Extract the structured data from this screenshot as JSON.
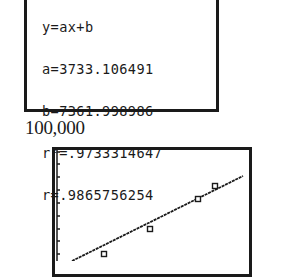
{
  "regression_screen": {
    "lines": [
      "y=ax+b",
      "a=3733.106491",
      "b=7361.998986",
      "r²=.9733314647",
      "r=.9865756254"
    ]
  },
  "graph": {
    "ymax_label": "100,000",
    "points_px": [
      [
        104,
        254
      ],
      [
        150,
        229
      ],
      [
        198,
        199
      ],
      [
        215,
        186
      ]
    ],
    "regression_line_px": [
      [
        72,
        261
      ],
      [
        243,
        176
      ]
    ],
    "yaxis_ticks_px": [
      152,
      164,
      177,
      190,
      203,
      216,
      229,
      241,
      254
    ]
  },
  "chart_data": {
    "type": "scatter",
    "title": "",
    "xlabel": "",
    "ylabel": "",
    "ylim": [
      0,
      100000
    ],
    "y_tick_label": "100,000",
    "regression": {
      "equation": "y=ax+b",
      "a": 3733.106491,
      "b": 7361.998986,
      "r2": 0.9733314647,
      "r": 0.9865756254
    },
    "series": [
      {
        "name": "data",
        "marker": "square",
        "points_approx_relative": [
          [
            0.26,
            0.09
          ],
          [
            0.5,
            0.28
          ],
          [
            0.74,
            0.51
          ],
          [
            0.83,
            0.61
          ]
        ]
      },
      {
        "name": "regression line",
        "style": "line"
      }
    ],
    "grid": false
  }
}
